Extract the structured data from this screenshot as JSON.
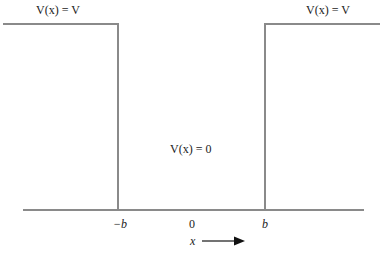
{
  "diagram": {
    "type": "finite square potential well",
    "labels": {
      "left_region": "V(x) = V",
      "right_region": "V(x) = V",
      "center_region": "V(x) = 0",
      "tick_neg_b": "−b",
      "tick_zero": "0",
      "tick_b": "b",
      "axis_label": "x"
    },
    "colors": {
      "line": "#8a8a8a",
      "text": "#222222",
      "background": "#ffffff"
    }
  }
}
